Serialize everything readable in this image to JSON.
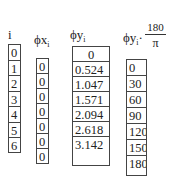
{
  "columns": [
    {
      "id": "i",
      "header": {
        "base": "i",
        "sub": ""
      },
      "values": [
        "0",
        "1",
        "2",
        "3",
        "4",
        "5",
        "6"
      ]
    },
    {
      "id": "phi_x",
      "header": {
        "base": "ϕx",
        "sub": "i"
      },
      "values": [
        "0",
        "0",
        "0",
        "0",
        "0",
        "0",
        "0"
      ]
    },
    {
      "id": "phi_y",
      "header": {
        "base": "ϕy",
        "sub": "i"
      },
      "values": [
        "0",
        "0.524",
        "1.047",
        "1.571",
        "2.094",
        "2.618",
        "3.142"
      ]
    },
    {
      "id": "phi_y_deg",
      "header": {
        "base": "ϕy",
        "sub": "i",
        "dot": "·",
        "numerator": "180",
        "denominator": "π"
      },
      "values": [
        "0",
        "30",
        "60",
        "90",
        "120",
        "150",
        "180"
      ]
    }
  ]
}
